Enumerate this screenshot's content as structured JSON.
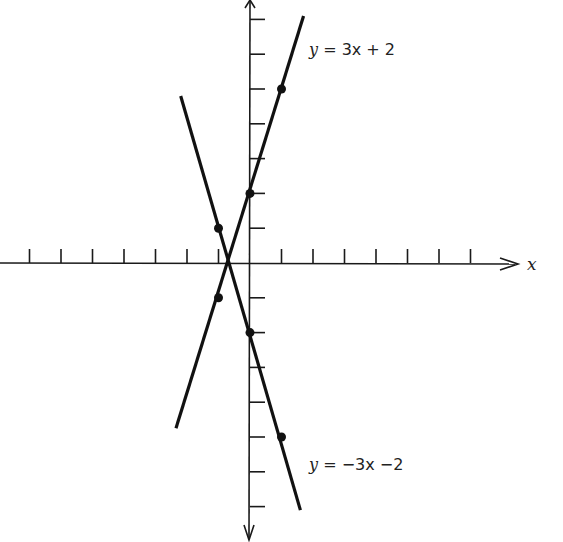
{
  "chart_data": {
    "type": "line",
    "title": "",
    "xlabel": "x",
    "ylabel": "y",
    "grid": false,
    "axis_ranges": {
      "x": [
        -8,
        8
      ],
      "y": [
        -8,
        7.5
      ]
    },
    "tick_step": 1,
    "series": [
      {
        "name": "y = 3x + 2",
        "equation": "y = 3x + 2",
        "slope": 3,
        "intercept": 2,
        "segment": [
          [
            -2.35,
            -4.75
          ],
          [
            1.7,
            7.1
          ]
        ],
        "points": [
          [
            -1,
            -1
          ],
          [
            0,
            2
          ],
          [
            1,
            5
          ]
        ]
      },
      {
        "name": "y = -3x - 2",
        "equation": "y = −3x −2",
        "slope": -3,
        "intercept": -2,
        "segment": [
          [
            -2.2,
            4.8
          ],
          [
            1.6,
            -7.1
          ]
        ],
        "points": [
          [
            -1,
            1
          ],
          [
            0,
            -2
          ],
          [
            1,
            -5
          ]
        ]
      }
    ],
    "annotations": [
      {
        "text": "y = 3x + 2",
        "near": [
          1.7,
          6.2
        ]
      },
      {
        "text": "y = −3x −2",
        "near": [
          1.7,
          -5.8
        ]
      }
    ]
  },
  "labels": {
    "line1_y": "y",
    "line1_rest": " = 3x + 2",
    "line2_y": "y",
    "line2_rest": " = −3x −2",
    "x_axis": "x"
  }
}
